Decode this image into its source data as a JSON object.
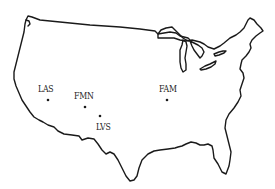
{
  "map": {
    "region": "Contiguous United States",
    "outline_color": "#1a1a1a",
    "background": "#ffffff"
  },
  "airports": [
    {
      "code": "LAS",
      "label_x": 38,
      "label_y": 85,
      "dot_x": 48,
      "dot_y": 100
    },
    {
      "code": "FMN",
      "label_x": 74,
      "label_y": 92,
      "dot_x": 85,
      "dot_y": 107
    },
    {
      "code": "LVS",
      "label_x": 96,
      "label_y": 123,
      "dot_x": 100,
      "dot_y": 116
    },
    {
      "code": "FAM",
      "label_x": 159,
      "label_y": 85,
      "dot_x": 167,
      "dot_y": 100
    }
  ]
}
